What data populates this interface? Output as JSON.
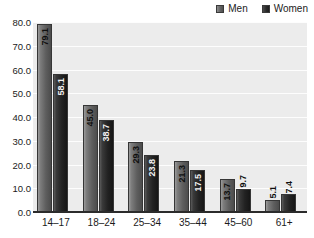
{
  "chart_data": {
    "type": "bar",
    "title": "",
    "xlabel": "",
    "ylabel": "",
    "ylim": [
      0,
      80
    ],
    "yticks": [
      "0.0",
      "10.0",
      "20.0",
      "30.0",
      "40.0",
      "50.0",
      "60.0",
      "70.0",
      "80.0"
    ],
    "grid": true,
    "legend_position": "top-right",
    "categories": [
      "14–17",
      "18–24",
      "25–34",
      "35–44",
      "45–60",
      "61+"
    ],
    "series": [
      {
        "name": "Men",
        "color": "#6b6b6b",
        "values": [
          79.1,
          45.0,
          29.3,
          21.3,
          13.7,
          5.1
        ],
        "labels": [
          "79.1",
          "45.0",
          "29.3",
          "21.3",
          "13.7",
          "5.1"
        ]
      },
      {
        "name": "Women",
        "color": "#262626",
        "values": [
          58.1,
          38.7,
          23.8,
          17.5,
          9.7,
          7.4
        ],
        "labels": [
          "58.1",
          "38.7",
          "23.8",
          "17.5",
          "9.7",
          "7.4"
        ]
      }
    ]
  },
  "legend": {
    "items": [
      {
        "label": "Men",
        "swatch": "men-swatch-icon"
      },
      {
        "label": "Women",
        "swatch": "women-swatch-icon"
      }
    ]
  },
  "colors": {
    "plot_background": "#ececec",
    "gridline": "#fdfdfd",
    "axis": "#2b2b2b",
    "text": "#1b1b1b",
    "men_bar": "#6b6b6b",
    "women_bar": "#262626"
  }
}
